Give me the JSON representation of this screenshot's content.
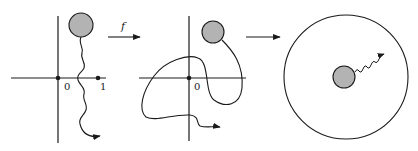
{
  "diagram": {
    "panel1": {
      "origin_label": "0",
      "unit_label": "1"
    },
    "arrow1": {
      "label": "f"
    },
    "panel2": {
      "origin_label": "0"
    },
    "arrow2": {
      "label": ""
    },
    "panel3": {},
    "colors": {
      "stroke": "#1a1a1a",
      "disk_fill": "#b3b3b3",
      "background": "#ffffff"
    }
  }
}
